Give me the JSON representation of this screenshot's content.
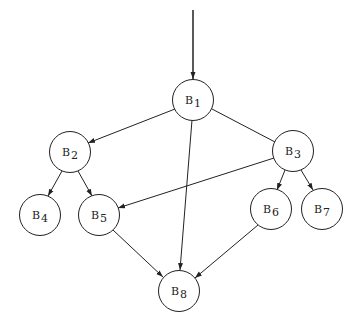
{
  "nodes": [
    {
      "id": "B1",
      "label": "B",
      "sub": "1",
      "x": 193,
      "y": 100
    },
    {
      "id": "B2",
      "label": "B",
      "sub": "2",
      "x": 70,
      "y": 152
    },
    {
      "id": "B3",
      "label": "B",
      "sub": "3",
      "x": 293,
      "y": 151
    },
    {
      "id": "B4",
      "label": "B",
      "sub": "4",
      "x": 40,
      "y": 215
    },
    {
      "id": "B5",
      "label": "B",
      "sub": "5",
      "x": 99,
      "y": 215
    },
    {
      "id": "B6",
      "label": "B",
      "sub": "6",
      "x": 271,
      "y": 209
    },
    {
      "id": "B7",
      "label": "B",
      "sub": "7",
      "x": 322,
      "y": 209
    },
    {
      "id": "B8",
      "label": "B",
      "sub": "8",
      "x": 179,
      "y": 291
    }
  ],
  "edges": [
    {
      "from": "entry",
      "to": "B1"
    },
    {
      "from": "B1",
      "to": "B2"
    },
    {
      "from": "B1",
      "to": "B3"
    },
    {
      "from": "B1",
      "to": "B8"
    },
    {
      "from": "B2",
      "to": "B4"
    },
    {
      "from": "B2",
      "to": "B5"
    },
    {
      "from": "B3",
      "to": "B5"
    },
    {
      "from": "B3",
      "to": "B6"
    },
    {
      "from": "B3",
      "to": "B7"
    },
    {
      "from": "B5",
      "to": "B8"
    },
    {
      "from": "B6",
      "to": "B8"
    }
  ],
  "colors": {
    "stroke": "#222222",
    "background": "#ffffff"
  }
}
